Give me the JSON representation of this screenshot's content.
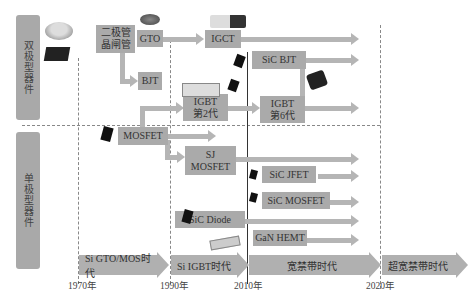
{
  "categories": {
    "bipolar": "双极型器件",
    "unipolar": "单极型器件"
  },
  "devices": {
    "thyristor": "二极管\n晶闸管",
    "gto": "GTO",
    "bjt": "BJT",
    "igct": "IGCT",
    "sic_bjt": "SiC BJT",
    "igbt_gen2": "IGBT\n第2代",
    "igbt_gen6": "IGBT\n第6代",
    "mosfet": "MOSFET",
    "sj_mosfet": "SJ\nMOSFET",
    "sic_jfet": "SiC JFET",
    "sic_mosfet": "SiC MOSFET",
    "sic_diode": "SiC Diode",
    "gan_hemt": "GaN HEMT"
  },
  "eras": [
    {
      "label": "Si GTO/MOS时代"
    },
    {
      "label": "Si IGBT时代"
    },
    {
      "label": "宽禁带时代"
    },
    {
      "label": "超宽禁带时代"
    }
  ],
  "years": [
    "1970年",
    "1990年",
    "2010年",
    "2020年"
  ],
  "colors": {
    "box": "#aaaaaa",
    "arrow": "#b5b5b5",
    "side_label": "#a9a9a9",
    "divider": "#888888",
    "line_2010": "#333333"
  }
}
